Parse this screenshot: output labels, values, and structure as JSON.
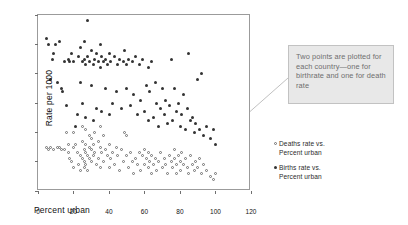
{
  "chart_data": {
    "type": "scatter",
    "title": "",
    "xlabel": "Percent urban",
    "ylabel": "Rate per 1000",
    "xlim": [
      0,
      120
    ],
    "ylim": [
      0,
      60
    ],
    "xticks": [
      0,
      20,
      40,
      60,
      80,
      100,
      120
    ],
    "yticks": [
      0,
      10,
      20,
      30,
      40,
      50,
      60
    ],
    "grid": false,
    "legend_position": "right",
    "series": [
      {
        "name": "Deaths rate vs. Percent urban",
        "marker": "open-circle",
        "color": "#6f6f6f",
        "points": [
          [
            5,
            15
          ],
          [
            6,
            14
          ],
          [
            7,
            15
          ],
          [
            9,
            14
          ],
          [
            11,
            15
          ],
          [
            12,
            15
          ],
          [
            13,
            14
          ],
          [
            15,
            14
          ],
          [
            16,
            20
          ],
          [
            17,
            16
          ],
          [
            17,
            13
          ],
          [
            18,
            11
          ],
          [
            19,
            10
          ],
          [
            20,
            20
          ],
          [
            20,
            15
          ],
          [
            20,
            8
          ],
          [
            21,
            16
          ],
          [
            22,
            13
          ],
          [
            23,
            9
          ],
          [
            24,
            12
          ],
          [
            24,
            7
          ],
          [
            25,
            22
          ],
          [
            25,
            17
          ],
          [
            25,
            11
          ],
          [
            26,
            14
          ],
          [
            26,
            10
          ],
          [
            26,
            8
          ],
          [
            27,
            21
          ],
          [
            27,
            16
          ],
          [
            27,
            13
          ],
          [
            27,
            9
          ],
          [
            28,
            12
          ],
          [
            28,
            7
          ],
          [
            29,
            19
          ],
          [
            29,
            15
          ],
          [
            29,
            11
          ],
          [
            30,
            18
          ],
          [
            30,
            14
          ],
          [
            30,
            10
          ],
          [
            31,
            16
          ],
          [
            31,
            12
          ],
          [
            32,
            20
          ],
          [
            32,
            13
          ],
          [
            33,
            9
          ],
          [
            34,
            17
          ],
          [
            34,
            11
          ],
          [
            35,
            22
          ],
          [
            35,
            15
          ],
          [
            35,
            8
          ],
          [
            36,
            13
          ],
          [
            37,
            19
          ],
          [
            37,
            10
          ],
          [
            38,
            14
          ],
          [
            39,
            12
          ],
          [
            40,
            16
          ],
          [
            40,
            8
          ],
          [
            41,
            11
          ],
          [
            42,
            13
          ],
          [
            43,
            9
          ],
          [
            44,
            15
          ],
          [
            45,
            12
          ],
          [
            46,
            7
          ],
          [
            47,
            14
          ],
          [
            48,
            10
          ],
          [
            49,
            20
          ],
          [
            50,
            19
          ],
          [
            50,
            12
          ],
          [
            51,
            8
          ],
          [
            52,
            13
          ],
          [
            53,
            10
          ],
          [
            54,
            6
          ],
          [
            55,
            11
          ],
          [
            56,
            9
          ],
          [
            57,
            13
          ],
          [
            58,
            7
          ],
          [
            59,
            12
          ],
          [
            60,
            14
          ],
          [
            60,
            9
          ],
          [
            61,
            11
          ],
          [
            62,
            13
          ],
          [
            62,
            8
          ],
          [
            63,
            10
          ],
          [
            64,
            12
          ],
          [
            64,
            6
          ],
          [
            65,
            9
          ],
          [
            66,
            11
          ],
          [
            67,
            7
          ],
          [
            68,
            10
          ],
          [
            69,
            13
          ],
          [
            70,
            8
          ],
          [
            71,
            11
          ],
          [
            72,
            9
          ],
          [
            73,
            6
          ],
          [
            74,
            12
          ],
          [
            75,
            10
          ],
          [
            76,
            8
          ],
          [
            77,
            14
          ],
          [
            77,
            11
          ],
          [
            78,
            9
          ],
          [
            78,
            6
          ],
          [
            79,
            12
          ],
          [
            80,
            10
          ],
          [
            80,
            7
          ],
          [
            81,
            13
          ],
          [
            82,
            9
          ],
          [
            83,
            11
          ],
          [
            84,
            8
          ],
          [
            85,
            6
          ],
          [
            86,
            12
          ],
          [
            87,
            9
          ],
          [
            88,
            7
          ],
          [
            89,
            10
          ],
          [
            90,
            8
          ],
          [
            91,
            11
          ],
          [
            92,
            6
          ],
          [
            93,
            9
          ],
          [
            95,
            7
          ],
          [
            97,
            5
          ],
          [
            99,
            4
          ],
          [
            100,
            6
          ]
        ]
      },
      {
        "name": "Births rate vs. Percent urban",
        "marker": "filled-circle",
        "color": "#333333",
        "points": [
          [
            5,
            52
          ],
          [
            6,
            50
          ],
          [
            7,
            38
          ],
          [
            8,
            45
          ],
          [
            9,
            47
          ],
          [
            10,
            50
          ],
          [
            11,
            37
          ],
          [
            12,
            51
          ],
          [
            13,
            35
          ],
          [
            14,
            34
          ],
          [
            15,
            44
          ],
          [
            16,
            29
          ],
          [
            17,
            45
          ],
          [
            18,
            44
          ],
          [
            19,
            47
          ],
          [
            20,
            44
          ],
          [
            21,
            22
          ],
          [
            22,
            26
          ],
          [
            23,
            46
          ],
          [
            24,
            49
          ],
          [
            24,
            37
          ],
          [
            25,
            30
          ],
          [
            25,
            44
          ],
          [
            26,
            51
          ],
          [
            26,
            45
          ],
          [
            27,
            43
          ],
          [
            27,
            25
          ],
          [
            28,
            58
          ],
          [
            28,
            46
          ],
          [
            29,
            44
          ],
          [
            30,
            48
          ],
          [
            30,
            36
          ],
          [
            31,
            43
          ],
          [
            31,
            24
          ],
          [
            32,
            45
          ],
          [
            33,
            47
          ],
          [
            33,
            28
          ],
          [
            34,
            44
          ],
          [
            35,
            50
          ],
          [
            35,
            42
          ],
          [
            36,
            46
          ],
          [
            36,
            27
          ],
          [
            37,
            44
          ],
          [
            38,
            35
          ],
          [
            38,
            45
          ],
          [
            39,
            43
          ],
          [
            40,
            47
          ],
          [
            40,
            26
          ],
          [
            41,
            44
          ],
          [
            42,
            30
          ],
          [
            43,
            46
          ],
          [
            44,
            34
          ],
          [
            45,
            43
          ],
          [
            46,
            45
          ],
          [
            47,
            28
          ],
          [
            48,
            44
          ],
          [
            49,
            48
          ],
          [
            50,
            35
          ],
          [
            50,
            43
          ],
          [
            51,
            45
          ],
          [
            52,
            29
          ],
          [
            53,
            44
          ],
          [
            54,
            33
          ],
          [
            55,
            46
          ],
          [
            56,
            26
          ],
          [
            57,
            43
          ],
          [
            58,
            31
          ],
          [
            59,
            45
          ],
          [
            60,
            27
          ],
          [
            61,
            36
          ],
          [
            62,
            42
          ],
          [
            62,
            24
          ],
          [
            63,
            34
          ],
          [
            64,
            44
          ],
          [
            65,
            25
          ],
          [
            66,
            37
          ],
          [
            67,
            30
          ],
          [
            68,
            22
          ],
          [
            69,
            28
          ],
          [
            70,
            35
          ],
          [
            71,
            26
          ],
          [
            72,
            31
          ],
          [
            73,
            23
          ],
          [
            74,
            29
          ],
          [
            75,
            45
          ],
          [
            76,
            24
          ],
          [
            77,
            35
          ],
          [
            78,
            27
          ],
          [
            79,
            30
          ],
          [
            80,
            22
          ],
          [
            81,
            26
          ],
          [
            82,
            33
          ],
          [
            83,
            21
          ],
          [
            84,
            28
          ],
          [
            85,
            47
          ],
          [
            86,
            24
          ],
          [
            87,
            25
          ],
          [
            88,
            20
          ],
          [
            89,
            23
          ],
          [
            90,
            38
          ],
          [
            91,
            21
          ],
          [
            92,
            40
          ],
          [
            93,
            19
          ],
          [
            95,
            22
          ],
          [
            97,
            18
          ],
          [
            99,
            21
          ],
          [
            100,
            16
          ]
        ]
      }
    ],
    "annotation": {
      "text": "Two points are plotted for each country—one for birthrate and one for death rate",
      "box_fill": "#e8e8e8",
      "box_border": "#c2c2c2",
      "text_color": "#6e6e6e"
    }
  },
  "axes": {
    "ylabel": "Rate per 1000",
    "xlabel": "Percent urban",
    "yticks": [
      "0",
      "10",
      "20",
      "30",
      "40",
      "50",
      "60"
    ],
    "xticks": [
      "0",
      "20",
      "40",
      "60",
      "80",
      "100",
      "120"
    ]
  },
  "legend": {
    "items": [
      {
        "marker": "open-circle-marker",
        "line1": "Deaths rate vs.",
        "line2": "Percent urban"
      },
      {
        "marker": "filled-circle-marker",
        "line1": "Births rate vs.",
        "line2": "Percent urban"
      }
    ]
  },
  "annotation": {
    "text": "Two points are plotted for each country—one for birthrate and one for death rate"
  }
}
